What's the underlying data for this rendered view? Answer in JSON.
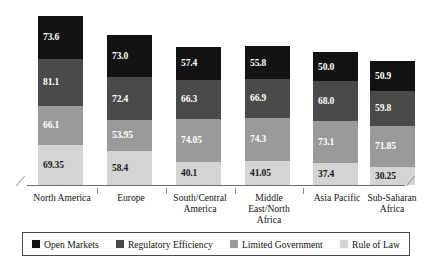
{
  "chart_data": {
    "type": "bar",
    "subtype": "stacked-3d-column",
    "title": "",
    "xlabel": "",
    "ylabel": "",
    "grid": false,
    "legend_position": "bottom",
    "categories": [
      "North America",
      "Europe",
      "South/Central America",
      "Middle East/North Africa",
      "Asia Pacific",
      "Sub-Saharan Africa"
    ],
    "series": [
      {
        "name": "Rule of Law",
        "color": "#d4d4d4",
        "values": [
          69.35,
          58.4,
          40.1,
          41.05,
          37.4,
          30.25
        ]
      },
      {
        "name": "Limited Government",
        "color": "#9a9a9a",
        "values": [
          66.1,
          53.95,
          74.05,
          74.3,
          73.1,
          71.85
        ]
      },
      {
        "name": "Regulatory Efficiency",
        "color": "#4a4a4a",
        "values": [
          81.1,
          72.4,
          66.3,
          66.9,
          68.0,
          59.8
        ]
      },
      {
        "name": "Open Markets",
        "color": "#121212",
        "values": [
          73.6,
          73.0,
          57.4,
          55.8,
          50.0,
          50.9
        ]
      }
    ],
    "totals": [
      290.15,
      257.75,
      237.85,
      238.05,
      228.5,
      212.8
    ],
    "stack_order_bottom_to_top": [
      "Rule of Law",
      "Limited Government",
      "Regulatory Efficiency",
      "Open Markets"
    ]
  },
  "legend": {
    "items": [
      {
        "label": "Open Markets",
        "color": "#121212"
      },
      {
        "label": "Regulatory Efficiency",
        "color": "#4a4a4a"
      },
      {
        "label": "Limited Government",
        "color": "#9a9a9a"
      },
      {
        "label": "Rule of Law",
        "color": "#d4d4d4"
      }
    ]
  },
  "categories_display": [
    {
      "line1": "North America",
      "line2": "",
      "line3": ""
    },
    {
      "line1": "Europe",
      "line2": "",
      "line3": ""
    },
    {
      "line1": "South/Central",
      "line2": "America",
      "line3": ""
    },
    {
      "line1": "Middle",
      "line2": "East/North",
      "line3": "Africa"
    },
    {
      "line1": "Asia Pacific",
      "line2": "",
      "line3": ""
    },
    {
      "line1": "Sub-Saharan",
      "line2": "Africa",
      "line3": ""
    }
  ],
  "bar_labels": [
    {
      "open_markets": "73.6",
      "regulatory_efficiency": "81.1",
      "limited_government": "66.1",
      "rule_of_law": "69.35"
    },
    {
      "open_markets": "73.0",
      "regulatory_efficiency": "72.4",
      "limited_government": "53.95",
      "rule_of_law": "58.4"
    },
    {
      "open_markets": "57.4",
      "regulatory_efficiency": "66.3",
      "limited_government": "74.05",
      "rule_of_law": "40.1"
    },
    {
      "open_markets": "55.8",
      "regulatory_efficiency": "66.9",
      "limited_government": "74.3",
      "rule_of_law": "41.05"
    },
    {
      "open_markets": "50.0",
      "regulatory_efficiency": "68.0",
      "limited_government": "73.1",
      "rule_of_law": "37.4"
    },
    {
      "open_markets": "50.9",
      "regulatory_efficiency": "59.8",
      "limited_government": "71.85",
      "rule_of_law": "30.25"
    }
  ]
}
